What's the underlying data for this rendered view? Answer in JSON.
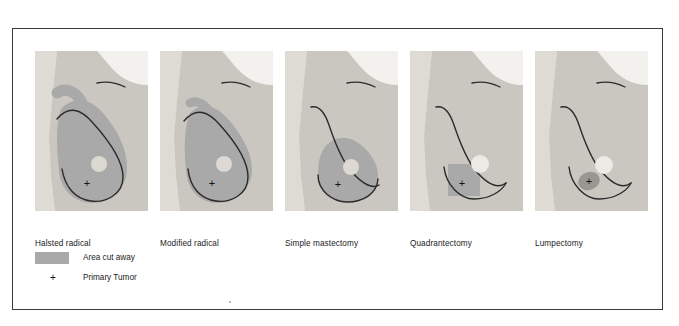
{
  "figure": {
    "border_color": "#3a3a3a"
  },
  "colors": {
    "panel_background": "#e6e4df",
    "torso": "#cac7c1",
    "arm_light": "#dedbd5",
    "void_white": "#f4f3f0",
    "cut_away_gray": "#a9a9a9",
    "lumpectomy_gray": "#9a9792",
    "nipple": "#dcd9d2",
    "contour_line": "#2b2b2b",
    "text": "#1a1a1a"
  },
  "panels": [
    {
      "id": "halsted-radical",
      "label": "Halsted radical",
      "description": "Entire breast plus chest wall muscle and axillary extension shaded as cut away",
      "cut_extent": "whole breast with axillary tail and pectoral muscle"
    },
    {
      "id": "modified-radical",
      "label": "Modified radical",
      "description": "Entire breast shaded as cut away with smaller axillary extension",
      "cut_extent": "whole breast, axillary nodes"
    },
    {
      "id": "simple-mastectomy",
      "label": "Simple mastectomy",
      "description": "Breast tissue only shaded as cut away, no axillary extension",
      "cut_extent": "whole breast only"
    },
    {
      "id": "quadrantectomy",
      "label": "Quadrantectomy",
      "description": "Rectangular quadrant of breast containing tumor shaded as cut away",
      "cut_extent": "one quadrant containing tumor"
    },
    {
      "id": "lumpectomy",
      "label": "Lumpectomy",
      "description": "Small oval region around the tumor shaded as cut away",
      "cut_extent": "tumor plus small margin"
    }
  ],
  "legend": {
    "items": [
      {
        "marker": "swatch",
        "label": "Area cut away"
      },
      {
        "marker": "plus",
        "symbol": "+",
        "label": "Primary Tumor"
      }
    ]
  },
  "tumor_marker": {
    "symbol": "+",
    "name": "primary-tumor-marker"
  }
}
